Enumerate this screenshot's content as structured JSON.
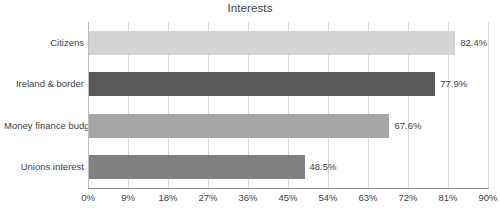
{
  "chart_data": {
    "type": "bar",
    "orientation": "horizontal",
    "title": "Interests",
    "xlabel": "",
    "ylabel": "",
    "categories": [
      "Citizens",
      "Ireland & border",
      "Money finance budget",
      "Unions interest"
    ],
    "values": [
      82.4,
      77.9,
      67.6,
      48.5
    ],
    "value_labels": [
      "82.4%",
      "77.9%",
      "67.6%",
      "48.5%"
    ],
    "bar_colors": [
      "#d4d4d4",
      "#595959",
      "#a6a6a6",
      "#808080"
    ],
    "xlim": [
      0,
      90
    ],
    "xticks": [
      0,
      9,
      18,
      27,
      36,
      45,
      54,
      63,
      72,
      81,
      90
    ],
    "xtick_labels": [
      "0%",
      "9%",
      "18%",
      "27%",
      "36%",
      "45%",
      "54%",
      "63%",
      "72%",
      "81%",
      "90%"
    ],
    "grid": true,
    "grid_axis": "x",
    "legend": false,
    "axis_color": "#8a8a8a",
    "gridline_color": "#d9d9d9",
    "text_color": "#3f3f3f",
    "background": "#ffffff"
  }
}
